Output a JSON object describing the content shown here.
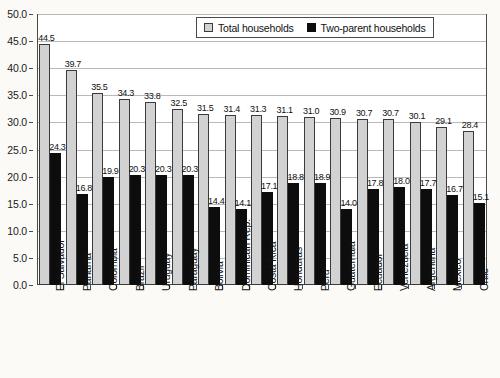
{
  "chart_data": {
    "type": "bar",
    "title": "",
    "xlabel": "",
    "ylabel": "",
    "ylim": [
      0,
      50
    ],
    "ytick_step": 5,
    "ytick_labels": [
      "0.0",
      "5.0",
      "10.0",
      "15.0",
      "20.0",
      "25.0",
      "30.0",
      "35.0",
      "40.0",
      "45.0",
      "50.0"
    ],
    "grid": true,
    "legend_position": "top-center",
    "categories": [
      "El Salvador",
      "Panama",
      "Colombia",
      "Brazil",
      "Uruguay",
      "Paraguay",
      "Bolivia",
      "Dominican Rep.",
      "Costa Rica",
      "Honduras",
      "Peru",
      "Guatemala",
      "Ecuador",
      "Venezuela",
      "Argentina",
      "Mexico",
      "Chile"
    ],
    "series": [
      {
        "name": "Total households",
        "color": "#d2d2d2",
        "values": [
          44.5,
          39.7,
          35.5,
          34.3,
          33.8,
          32.5,
          31.5,
          31.4,
          31.3,
          31.1,
          31.0,
          30.9,
          30.7,
          30.7,
          30.1,
          29.1,
          28.4
        ],
        "labels": [
          "44.5",
          "39.7",
          "35.5",
          "34.3",
          "33.8",
          "32.5",
          "31.5",
          "31.4",
          "31.3",
          "31.1",
          "31.0",
          "30.9",
          "30.7",
          "30.7",
          "30.1",
          "29.1",
          "28.4"
        ]
      },
      {
        "name": "Two-parent households",
        "color": "#0d0d0d",
        "values": [
          24.3,
          16.8,
          19.9,
          20.3,
          20.3,
          20.3,
          14.4,
          14.1,
          17.1,
          18.8,
          18.9,
          14.0,
          17.8,
          18.0,
          17.7,
          16.7,
          15.1
        ],
        "labels": [
          "24.3",
          "16.8",
          "19.9",
          "20.3",
          "20.3",
          "20.3",
          "14.4",
          "14.1",
          "17.1",
          "18.8",
          "18.9",
          "14.0",
          "17.8",
          "18.0",
          "17.7",
          "16.7",
          "15.1"
        ]
      }
    ]
  },
  "legend": {
    "entries": [
      {
        "label": "Total households"
      },
      {
        "label": "Two-parent households"
      }
    ]
  }
}
